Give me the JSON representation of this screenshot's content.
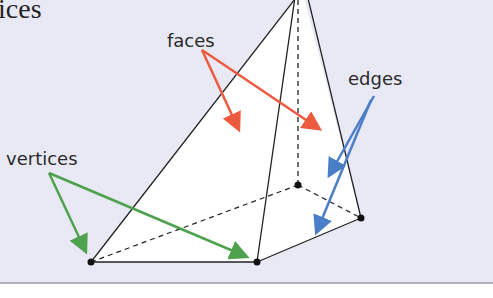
{
  "diagram": {
    "title_fragment": "ices",
    "labels": {
      "faces": "faces",
      "edges": "edges",
      "vertices": "vertices"
    },
    "colors": {
      "background": "#e9e9f5",
      "border": "#9a9aa8",
      "faces_arrow": "#ec5a3f",
      "edges_arrow": "#4a7fc8",
      "vertices_arrow": "#4ea24e",
      "line": "#222222"
    }
  }
}
